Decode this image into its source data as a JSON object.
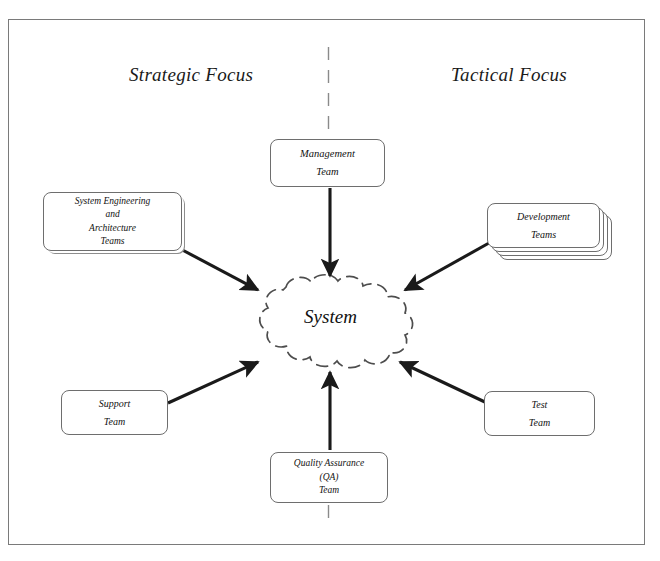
{
  "diagram": {
    "title_left": "Strategic Focus",
    "title_right": "Tactical Focus",
    "center_label": "System",
    "divider": "dashed-vertical-axis",
    "colors": {
      "frame_border": "#7a7a7a",
      "node_border": "#6e6e6e",
      "arrow": "#1a1a1a",
      "cloud_outline": "#4d4d4d",
      "background": "#ffffff",
      "text": "#111111"
    }
  },
  "nodes": {
    "management": {
      "name": "Management Team",
      "lines": [
        "Management",
        "Team"
      ]
    },
    "system_engineering": {
      "name": "System Engineering and Architecture Teams",
      "lines": [
        "System Engineering",
        "and",
        "Architecture",
        "Teams"
      ]
    },
    "development": {
      "name": "Development Teams",
      "lines": [
        "Development",
        "Teams"
      ],
      "stacked": "true"
    },
    "support": {
      "name": "Support Team",
      "lines": [
        "Support",
        "Team"
      ]
    },
    "test": {
      "name": "Test Team",
      "lines": [
        "Test",
        "Team"
      ]
    },
    "quality_assurance": {
      "name": "Quality Assurance (QA) Team",
      "lines": [
        "Quality Assurance",
        "(QA)",
        "Team"
      ]
    },
    "system": {
      "name": "System",
      "shape": "dashed-cloud"
    }
  },
  "edges": [
    {
      "id": "sysengr-to-system",
      "from": "system_engineering",
      "to": "system",
      "direction": "to-system",
      "style": "thick-solid-arrow"
    },
    {
      "id": "management-to-system",
      "from": "management",
      "to": "system",
      "direction": "to-system",
      "style": "thick-solid-arrow"
    },
    {
      "id": "development-to-system",
      "from": "development",
      "to": "system",
      "direction": "to-system",
      "style": "thick-solid-arrow"
    },
    {
      "id": "support-to-system",
      "from": "support",
      "to": "system",
      "direction": "to-system",
      "style": "thick-solid-arrow"
    },
    {
      "id": "qa-to-system",
      "from": "quality_assurance",
      "to": "system",
      "direction": "to-system",
      "style": "thick-solid-arrow"
    },
    {
      "id": "test-to-system",
      "from": "test",
      "to": "system",
      "direction": "to-system",
      "style": "thick-solid-arrow"
    }
  ]
}
